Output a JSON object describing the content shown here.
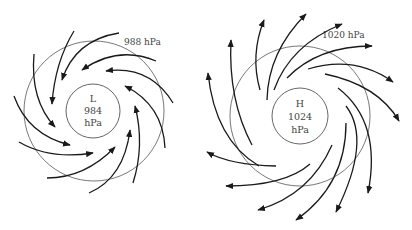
{
  "low": {
    "center_letter": "L",
    "center_pressure": "984",
    "center_unit": "hPa",
    "isobar_label": "988 hPa",
    "flow": "inward, counterclockwise"
  },
  "high": {
    "center_letter": "H",
    "center_pressure": "1024",
    "center_unit": "hPa",
    "isobar_label": "1020 hPa",
    "flow": "outward, clockwise"
  },
  "colors": {
    "arrow": "#1a1a1a",
    "isobar": "#555555",
    "text": "#444444",
    "background": "#ffffff"
  }
}
